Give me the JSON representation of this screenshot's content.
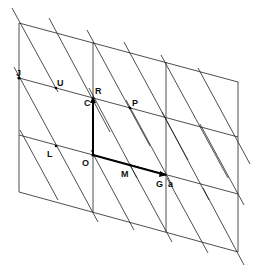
{
  "diagram": {
    "title": "",
    "colors": {
      "line": "#222222",
      "background": "#ffffff"
    },
    "labels": {
      "J": "J",
      "U": "U",
      "R": "R",
      "C": "C",
      "P": "P",
      "L": "L",
      "O": "O",
      "M": "M",
      "G": "G",
      "a": "a"
    }
  }
}
